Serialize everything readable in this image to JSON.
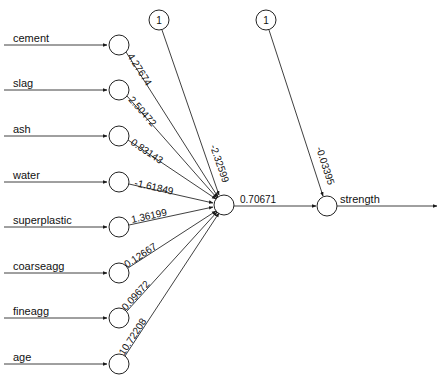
{
  "diagram": {
    "type": "neural-network",
    "layers": {
      "input": {
        "nodes": [
          {
            "label": "cement",
            "weight": "4.27674"
          },
          {
            "label": "slag",
            "weight": "2.50472"
          },
          {
            "label": "ash",
            "weight": "0.83143"
          },
          {
            "label": "water",
            "weight": "-1.61849"
          },
          {
            "label": "superplastic",
            "weight": "1.36199"
          },
          {
            "label": "coarseagg",
            "weight": "0.12667"
          },
          {
            "label": "fineagg",
            "weight": "0.09672"
          },
          {
            "label": "age",
            "weight": "10.72208"
          }
        ]
      },
      "hidden": {
        "nodes": [
          {
            "output_weight": "0.70671"
          }
        ]
      },
      "output": {
        "nodes": [
          {
            "label": "strength"
          }
        ]
      }
    },
    "bias_nodes": [
      {
        "label": "1",
        "target": "hidden",
        "weight": "-2.32599"
      },
      {
        "label": "1",
        "target": "output",
        "weight": "-0.03395"
      }
    ],
    "colors": {
      "edge": "#2a2a2a",
      "node_stroke": "#222222",
      "node_fill": "#ffffff",
      "text": "#111111",
      "background": "#ffffff"
    }
  }
}
